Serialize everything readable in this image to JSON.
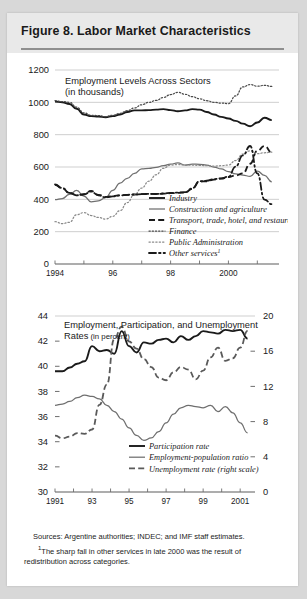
{
  "figure": {
    "title": "Figure 8. Labor Market Characteristics",
    "sources_line1": "Sources: Argentine authorities; INDEC; and IMF staff estimates.",
    "sources_line2": "The sharp fall in other services in late 2000 was the result of",
    "sources_line3": "redistribution across categories.",
    "footnote_marker": "1"
  },
  "chart_data": [
    {
      "type": "line",
      "id": "employment-levels",
      "title": "Employment Levels Across Sectors",
      "subtitle": "(in thousands)",
      "xlabel": "",
      "ylabel": "",
      "ylim": [
        0,
        1200
      ],
      "yticks": [
        0,
        200,
        400,
        600,
        800,
        1000,
        1200
      ],
      "ytick_labels": [
        "0",
        "200",
        "400",
        "600",
        "800",
        "1000",
        "1200"
      ],
      "xlim": [
        1994,
        2001.75
      ],
      "xticks": [
        1994,
        1996,
        1998,
        2000
      ],
      "xtick_labels": [
        "1994",
        "96",
        "98",
        "2000"
      ],
      "grid": true,
      "legend_position": "inside-bottom-center",
      "x": [
        1994.0,
        1994.25,
        1994.5,
        1994.75,
        1995.0,
        1995.25,
        1995.5,
        1995.75,
        1996.0,
        1996.25,
        1996.5,
        1996.75,
        1997.0,
        1997.25,
        1997.5,
        1997.75,
        1998.0,
        1998.25,
        1998.5,
        1998.75,
        1999.0,
        1999.25,
        1999.5,
        1999.75,
        2000.0,
        2000.25,
        2000.5,
        2000.75,
        2001.0,
        2001.25,
        2001.5
      ],
      "series": [
        {
          "name": "Industry",
          "style": "solid-thick",
          "color": "#1a1a1a",
          "values": [
            1005,
            1000,
            990,
            960,
            925,
            915,
            912,
            908,
            915,
            925,
            940,
            950,
            950,
            952,
            955,
            958,
            952,
            945,
            950,
            958,
            955,
            940,
            925,
            910,
            900,
            885,
            868,
            852,
            875,
            905,
            890
          ]
        },
        {
          "name": "Construction and agriculture",
          "style": "solid-thin",
          "color": "#6f6f6f",
          "values": [
            398,
            405,
            430,
            455,
            420,
            385,
            390,
            410,
            455,
            500,
            530,
            560,
            588,
            592,
            598,
            608,
            618,
            625,
            612,
            618,
            617,
            612,
            600,
            588,
            572,
            558,
            550,
            542,
            575,
            548,
            508
          ]
        },
        {
          "name": "Transport, trade, hotel, and restaurants",
          "style": "dashed-thick",
          "color": "#1a1a1a",
          "values": [
            490,
            468,
            440,
            425,
            432,
            452,
            428,
            415,
            420,
            425,
            428,
            430,
            432,
            434,
            433,
            435,
            438,
            440,
            442,
            465,
            510,
            512,
            522,
            528,
            538,
            548,
            560,
            620,
            700,
            730,
            690
          ]
        },
        {
          "name": "Finance",
          "style": "dotted",
          "color": "#4a4a4a",
          "values": [
            1010,
            1005,
            1000,
            970,
            935,
            920,
            918,
            912,
            920,
            932,
            948,
            965,
            985,
            1000,
            1012,
            1030,
            1048,
            1062,
            1050,
            1035,
            1022,
            1010,
            1000,
            995,
            992,
            1040,
            1095,
            1110,
            1100,
            1105,
            1098
          ]
        },
        {
          "name": "Public Administration",
          "style": "dotted-light",
          "color": "#8a8a8a",
          "values": [
            262,
            250,
            258,
            305,
            318,
            300,
            288,
            278,
            295,
            330,
            380,
            430,
            470,
            512,
            552,
            592,
            612,
            615,
            612,
            612,
            610,
            608,
            605,
            608,
            612,
            640,
            680,
            700,
            682,
            688,
            692
          ]
        },
        {
          "name": "Other services",
          "style": "dashdot",
          "color": "#1a1a1a",
          "values": [
            492,
            470,
            440,
            425,
            430,
            448,
            425,
            412,
            418,
            424,
            428,
            430,
            432,
            434,
            433,
            436,
            440,
            442,
            444,
            468,
            512,
            515,
            525,
            530,
            540,
            602,
            672,
            730,
            560,
            398,
            370
          ]
        }
      ]
    },
    {
      "type": "line",
      "id": "employment-participation-unemployment",
      "title": "Employment, Participation, and Unemployment",
      "subtitle": "Rates (in percent)",
      "xlabel": "",
      "ylabel": "",
      "ylim": [
        30,
        44
      ],
      "yticks": [
        30,
        32,
        34,
        36,
        38,
        40,
        42,
        44
      ],
      "ytick_labels": [
        "30",
        "32",
        "34",
        "36",
        "38",
        "40",
        "42",
        "44"
      ],
      "y2lim": [
        0,
        20
      ],
      "y2ticks": [
        0,
        4,
        8,
        12,
        16,
        20
      ],
      "y2tick_labels": [
        "0",
        "4",
        "8",
        "12",
        "16",
        "20"
      ],
      "xlim": [
        1991,
        2001.8
      ],
      "xticks": [
        1991,
        1993,
        1995,
        1997,
        1999,
        2001
      ],
      "xtick_labels": [
        "1991",
        "93",
        "95",
        "97",
        "99",
        "2001"
      ],
      "grid": false,
      "legend_position": "inside-bottom-center",
      "x": [
        1991.0,
        1991.4,
        1991.8,
        1992.2,
        1992.6,
        1993.0,
        1993.4,
        1993.8,
        1994.2,
        1994.6,
        1995.0,
        1995.4,
        1995.8,
        1996.2,
        1996.6,
        1997.0,
        1997.4,
        1997.8,
        1998.2,
        1998.6,
        1999.0,
        1999.4,
        1999.8,
        2000.2,
        2000.6,
        2001.0,
        2001.4
      ],
      "series": [
        {
          "name": "Participation rate",
          "style": "solid-thick",
          "color": "#1a1a1a",
          "axis": "left",
          "values": [
            39.6,
            39.6,
            39.9,
            40.2,
            40.4,
            41.6,
            41.2,
            41.3,
            41.0,
            42.8,
            41.6,
            41.1,
            41.9,
            41.8,
            42.1,
            42.2,
            41.9,
            42.4,
            42.1,
            42.4,
            42.8,
            42.7,
            42.6,
            42.9,
            42.8,
            42.9,
            42.2
          ]
        },
        {
          "name": "Employment-population ratio",
          "style": "solid-thin",
          "color": "#6f6f6f",
          "axis": "left",
          "values": [
            36.9,
            37.0,
            37.2,
            37.5,
            37.7,
            37.6,
            37.4,
            36.9,
            36.4,
            35.8,
            35.1,
            34.5,
            34.1,
            34.3,
            34.8,
            35.5,
            36.2,
            36.7,
            36.9,
            36.8,
            36.7,
            36.9,
            36.4,
            36.8,
            36.3,
            35.5,
            34.7
          ]
        },
        {
          "name": "Unemployment rate (right scale)",
          "style": "dashed-thick",
          "color": "#5a5a5a",
          "axis": "right",
          "values": [
            6.4,
            6.1,
            6.3,
            6.7,
            6.6,
            7.1,
            9.9,
            12.2,
            17.4,
            18.8,
            17.1,
            16.3,
            15.1,
            14.2,
            13.0,
            12.7,
            13.6,
            14.2,
            13.9,
            12.8,
            13.8,
            15.3,
            16.4,
            14.9,
            15.2,
            16.4,
            18.3
          ]
        }
      ]
    }
  ]
}
